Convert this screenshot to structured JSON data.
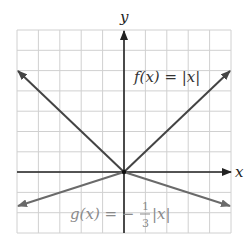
{
  "chart_data": {
    "type": "line",
    "title": "",
    "xlabel": "x",
    "ylabel": "y",
    "xlim": [
      -5,
      5
    ],
    "ylim": [
      -3,
      7
    ],
    "grid": true,
    "tick_labels": false,
    "series": [
      {
        "name": "f(x) = |x|",
        "expression": "|x|",
        "color": "#444444",
        "points": [
          [
            -5,
            5
          ],
          [
            0,
            0
          ],
          [
            5,
            5
          ]
        ],
        "arrows": "both ends"
      },
      {
        "name": "g(x) = -1/3|x|",
        "expression": "-(1/3)|x|",
        "color": "#666666",
        "points": [
          [
            -5,
            -1.6667
          ],
          [
            0,
            0
          ],
          [
            5,
            -1.6667
          ]
        ],
        "arrows": "both ends"
      }
    ],
    "annotations": [
      {
        "text": "f(x) = |x|",
        "x": 2.6,
        "y": 4.7
      },
      {
        "text": "g(x) = -1/3|x|",
        "x": -2.6,
        "y": -2.1
      }
    ]
  },
  "labels": {
    "x_axis": "x",
    "y_axis": "y",
    "f_label": "f(x) = |x|",
    "g_prefix": "g(x) = −",
    "g_num": "1",
    "g_den": "3",
    "g_suffix": "|x|"
  },
  "colors": {
    "grid": "#d0d0d0",
    "axis": "#222222",
    "f_line": "#444444",
    "g_line": "#6a6a6a",
    "g_text": "#8a8a8a",
    "f_text": "#333333"
  }
}
